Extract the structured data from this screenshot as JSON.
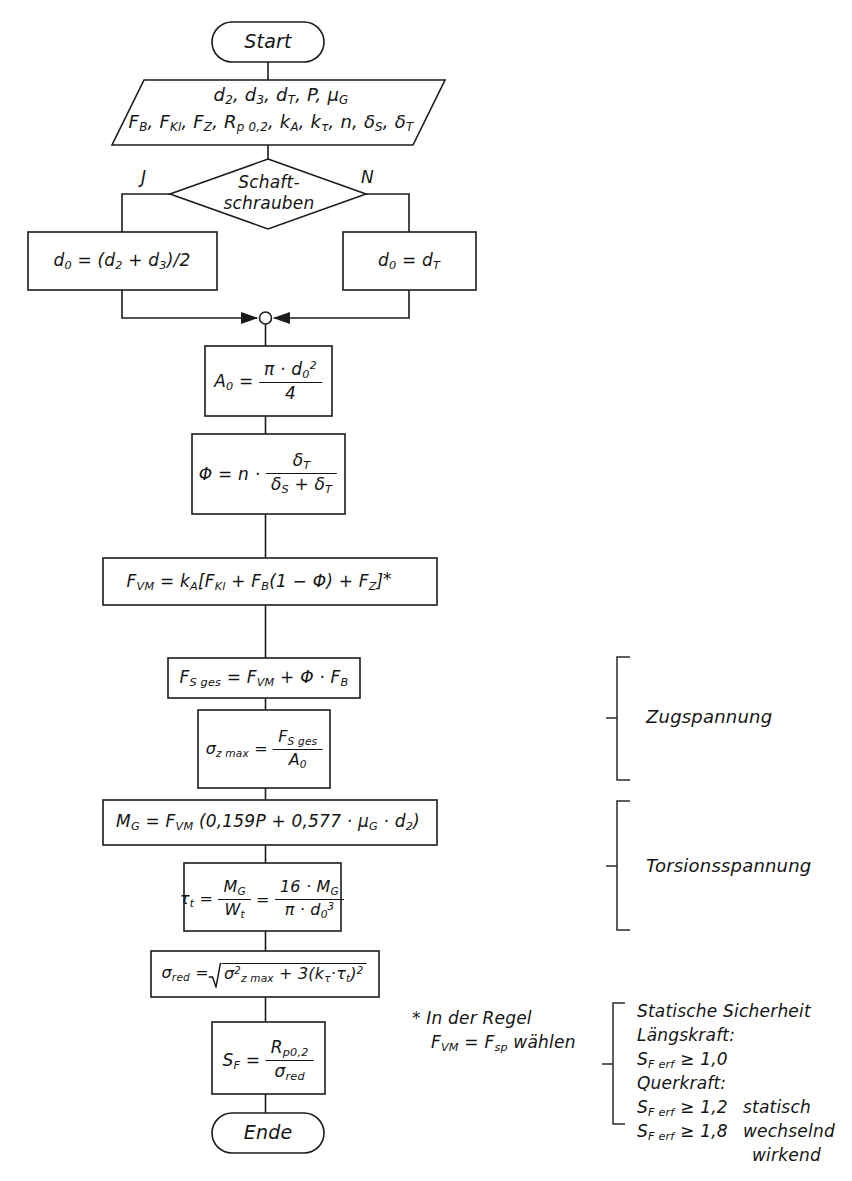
{
  "diagram": {
    "language": "de",
    "line_color": "#1b1b1b",
    "background": "#ffffff"
  },
  "nodes": {
    "start": {
      "type": "terminator",
      "label": "Start"
    },
    "inputs": {
      "type": "input-output",
      "line1": "d2, d3, dT, P, µG",
      "line2": "FB, FKl, FZ, Rp 0,2, kA, kτ, n, δS, δT"
    },
    "decision": {
      "type": "decision",
      "line1": "Schaft-",
      "line2": "schrauben",
      "yes_label": "J",
      "no_label": "N"
    },
    "d0_yes": {
      "type": "process",
      "formula": "d0 = (d2 + d3)/2"
    },
    "d0_no": {
      "type": "process",
      "formula": "d0 = dT"
    },
    "merge": {
      "type": "junction"
    },
    "area": {
      "type": "process",
      "lhs": "A0 =",
      "num": "π · d0²",
      "den": "4"
    },
    "phi": {
      "type": "process",
      "lhs": "Φ = n ·",
      "num": "δT",
      "den": "δS + δT"
    },
    "fvm": {
      "type": "process",
      "formula": "FVM = kA[FKl + FB(1 − Φ) + FZ]",
      "footnote_marker": "*"
    },
    "fsges": {
      "type": "process",
      "formula": "FS ges = FVM + Φ · FB"
    },
    "sigma_z": {
      "type": "process",
      "lhs": "σz max =",
      "num": "FS ges",
      "den": "A0"
    },
    "mg": {
      "type": "process",
      "formula": "MG = FVM (0,159P + 0,577 · µG · d2)"
    },
    "tau": {
      "type": "process",
      "lhs": "τt =",
      "num1": "MG",
      "den1": "Wt",
      "eq": "=",
      "num2": "16 · MG",
      "den2": "π · d0³"
    },
    "sigma_red": {
      "type": "process",
      "lhs": "σred =",
      "radicand": "σ²z max + 3(kτ · τt)²"
    },
    "sf": {
      "type": "process",
      "lhs": "SF =",
      "num": "Rp0,2",
      "den": "σred"
    },
    "end": {
      "type": "terminator",
      "label": "Ende"
    }
  },
  "annotations": {
    "bracket_tension": {
      "label": "Zugspannung"
    },
    "bracket_torsion": {
      "label": "Torsionsspannung"
    },
    "footnote": {
      "line1": "* In der Regel",
      "line2": "FVM = Fsp wählen"
    },
    "safety": {
      "line1": "Statische Sicherheit",
      "line2": "Längskraft:",
      "line3": "SF erf ≥ 1,0",
      "line4": "Querkraft:",
      "line5": "SF erf ≥ 1,2",
      "line5b": "statisch",
      "line6": "SF erf ≥ 1,8",
      "line6b": "wechselnd",
      "line7": "wirkend"
    }
  }
}
